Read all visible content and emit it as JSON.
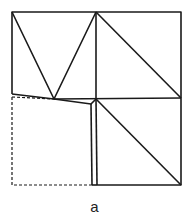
{
  "figure": {
    "caption": "a",
    "stroke_color": "#1a1a1a"
  }
}
